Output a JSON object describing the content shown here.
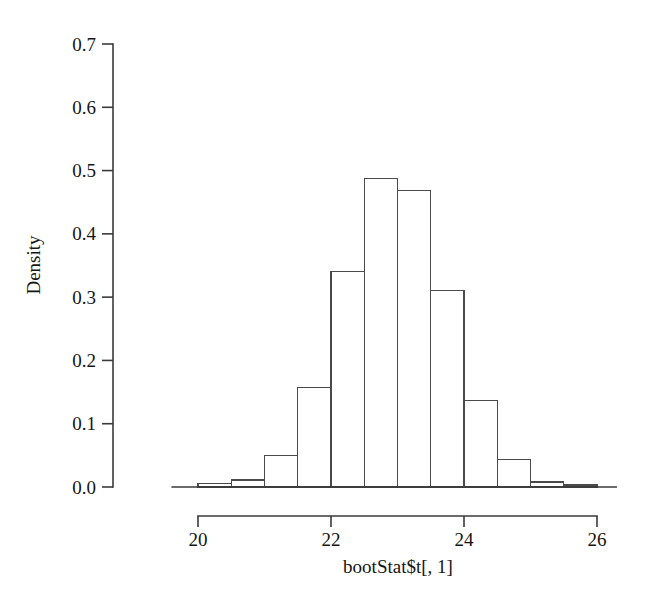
{
  "chart_data": {
    "type": "bar",
    "title": "",
    "xlabel": "bootStat$t[, 1]",
    "ylabel": "Density",
    "xlim": [
      19.6,
      26.3
    ],
    "ylim": [
      0.0,
      0.7
    ],
    "grid": false,
    "legend": "none",
    "bin_width": 0.5,
    "bin_edges": [
      20.0,
      20.5,
      21.0,
      21.5,
      22.0,
      22.5,
      23.0,
      23.5,
      24.0,
      24.5,
      25.0,
      25.5,
      26.0
    ],
    "categories": [
      "20.0-20.5",
      "20.5-21.0",
      "21.0-21.5",
      "21.5-22.0",
      "22.0-22.5",
      "22.5-23.0",
      "23.0-23.5",
      "23.5-24.0",
      "24.0-24.5",
      "24.5-25.0",
      "25.0-25.5",
      "25.5-26.0"
    ],
    "values": [
      0.005,
      0.011,
      0.05,
      0.157,
      0.34,
      0.487,
      0.468,
      0.31,
      0.137,
      0.044,
      0.008,
      0.003
    ],
    "xticks": [
      20,
      22,
      24,
      26
    ],
    "xtick_labels": [
      "20",
      "22",
      "24",
      "26"
    ],
    "yticks": [
      0.0,
      0.1,
      0.2,
      0.3,
      0.4,
      0.5,
      0.6,
      0.7
    ],
    "ytick_labels": [
      "0.0",
      "0.1",
      "0.2",
      "0.3",
      "0.4",
      "0.5",
      "0.6",
      "0.7"
    ],
    "bar_color": "#ffffff",
    "bar_edge_color": "#4a4a4a",
    "background_color": "#ffffff"
  }
}
